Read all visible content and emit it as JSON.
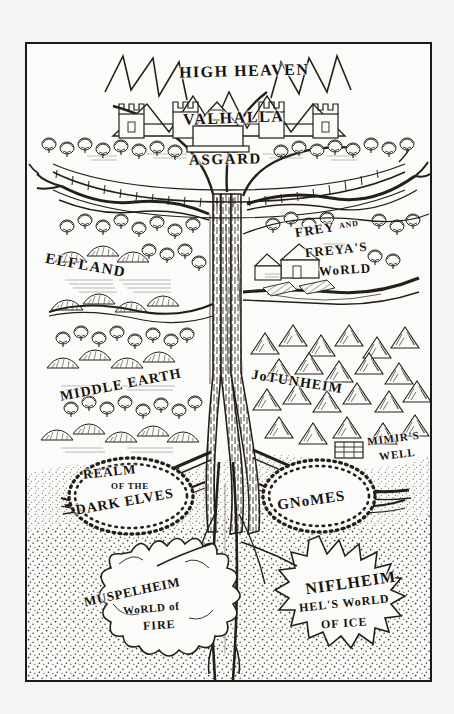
{
  "plate": {
    "title": "Yggdrasil — The Norse World Tree",
    "medium": "pen-and-ink engraving",
    "frame_color": "#1a1a1a",
    "paper_color": "#fbfbf9",
    "ink_color": "#16130f",
    "background_color": "#f4f4f3"
  },
  "labels": {
    "high_heaven": "HIGH HEAVEN",
    "valhalla": "VALHALLA",
    "asgard": "ASGARD",
    "elfland": "ELFLAND",
    "frey_line1": "FREY",
    "frey_and": "AND",
    "frey_line2": "FREYA'S",
    "frey_line3": "WoRLD",
    "middle_earth": "MIDDLE EARTH",
    "jotunheim": "JoTUNHEIM",
    "mimirs": "MIMIR'S",
    "well": "WELL",
    "realm": "REALM",
    "of_the": "OF THE",
    "dark_elves": "DARK ELVES",
    "gnomes": "GNoMES",
    "muspelheim": "MUSPELHEIM",
    "world_of": "WoRLD of",
    "fire": "FIRE",
    "niflheim": "NIFLHEIM",
    "hels_world": "HEL'S WoRLD",
    "of_ice": "OF ICE"
  },
  "realms": [
    {
      "name": "HIGH HEAVEN",
      "tier": "upper",
      "icon": "lightning-crown-icon"
    },
    {
      "name": "VALHALLA",
      "tier": "upper",
      "icon": "castle-hall-icon"
    },
    {
      "name": "ASGARD",
      "tier": "upper",
      "icon": "fenced-enclosure-icon"
    },
    {
      "name": "ELFLAND",
      "tier": "middle-left",
      "icon": "hills-forest-icon"
    },
    {
      "name": "FREY AND FREYA'S WoRLD",
      "tier": "middle-right",
      "icon": "farmstead-icon"
    },
    {
      "name": "MIDDLE EARTH",
      "tier": "middle-left",
      "icon": "hills-forest-icon"
    },
    {
      "name": "JoTUNHEIM",
      "tier": "middle-right",
      "icon": "mountain-range-icon"
    },
    {
      "name": "MIMIR'S WELL",
      "tier": "middle-right",
      "icon": "stone-well-icon"
    },
    {
      "name": "REALM OF THE DARK ELVES",
      "tier": "under-left",
      "icon": "cavern-icon"
    },
    {
      "name": "GNoMES",
      "tier": "under-right",
      "icon": "cavern-icon"
    },
    {
      "name": "MUSPELHEIM — WoRLD of FIRE",
      "tier": "lower-left",
      "icon": "flame-burst-icon"
    },
    {
      "name": "NIFLHEIM — HEL'S WoRLD OF ICE",
      "tier": "lower-right",
      "icon": "ice-burst-icon"
    }
  ]
}
